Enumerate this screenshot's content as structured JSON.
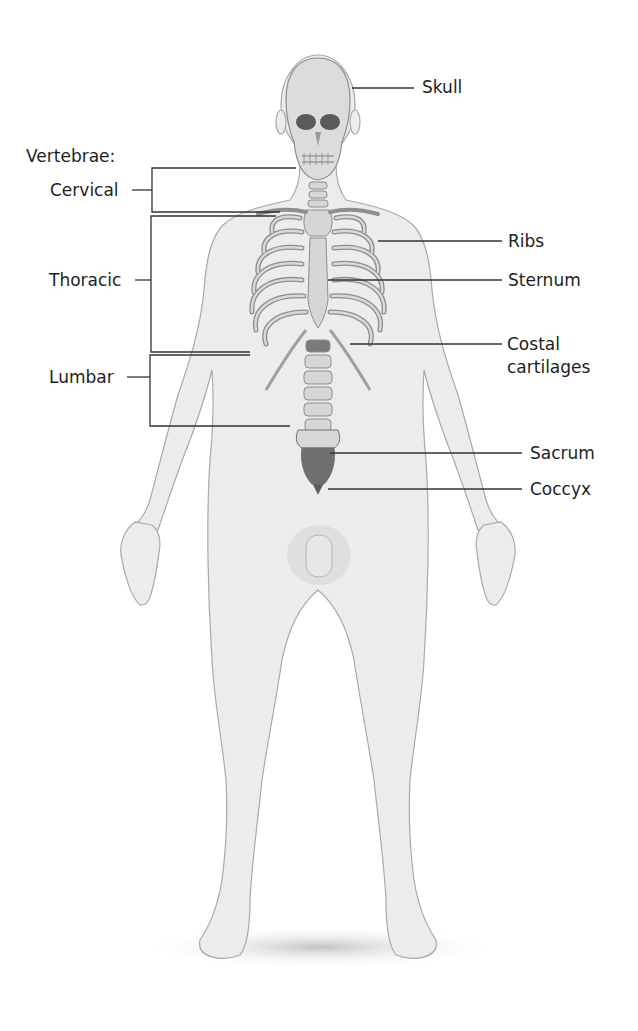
{
  "figure": {
    "colors": {
      "background": "#ffffff",
      "skin_fill": "#ececec",
      "skin_stroke": "#a9a9a9",
      "bone_fill": "#d6d6d6",
      "bone_stroke": "#8e8e8e",
      "sacrum_fill": "#6f6f6f",
      "leader_line": "#333333",
      "label_text": "#1e1e1e"
    }
  },
  "labels": {
    "skull": "Skull",
    "vertebrae_heading": "Vertebrae:",
    "cervical": "Cervical",
    "thoracic": "Thoracic",
    "lumbar": "Lumbar",
    "ribs": "Ribs",
    "sternum": "Sternum",
    "costal_line1": "Costal",
    "costal_line2": "cartilages",
    "sacrum": "Sacrum",
    "coccyx": "Coccyx"
  }
}
